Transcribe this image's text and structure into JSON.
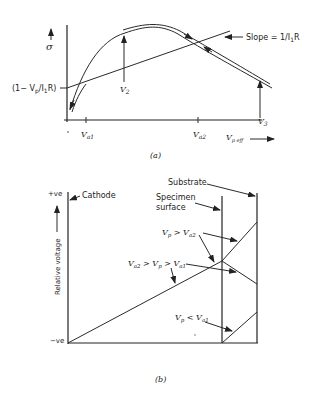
{
  "figure_a": {
    "caption": "(a)",
    "y_axis_label": "σ",
    "x_axis_label_main": "V",
    "x_axis_label_sub": "p eff",
    "intercept_label": "(1− V",
    "intercept_label_sub": "p",
    "intercept_label_rest": "/I",
    "intercept_label_sub2": "1",
    "intercept_label_end": "R)",
    "slope_label": "Slope = 1/I",
    "slope_label_sub": "1",
    "slope_label_end": "R",
    "ticks": [
      {
        "main": "V",
        "sub": "a1"
      },
      {
        "main": "V",
        "sub": "a2"
      }
    ],
    "markers": [
      {
        "main": "V",
        "sub": "2"
      },
      {
        "main": "V",
        "sub": "3"
      }
    ]
  },
  "figure_b": {
    "caption": "(b)",
    "y_axis_label": "Relative voltage",
    "y_top_label": "+ve",
    "y_bottom_label": "−ve",
    "cathode_label": "Cathode",
    "substrate_label": "Substrate",
    "specimen_label_line1": "Specimen",
    "specimen_label_line2": "surface",
    "conditions": [
      {
        "id": "gt_a2",
        "text": "V",
        "sub1": "p",
        "op": " > V",
        "sub2": "a2"
      },
      {
        "id": "between",
        "text": "V",
        "sub1": "a2",
        "op": " > V",
        "sub2": "p",
        "op2": " > V",
        "sub3": "a1"
      },
      {
        "id": "lt_a1",
        "text": "V",
        "sub1": "p",
        "op": " < V",
        "sub2": "a1"
      }
    ]
  }
}
